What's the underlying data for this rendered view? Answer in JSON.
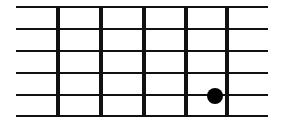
{
  "diagram": {
    "type": "fretboard",
    "colors": {
      "background": "#ffffff",
      "line": "#111111",
      "dot": "#000000"
    },
    "strings": [
      {
        "y": 7,
        "x1": 16,
        "x2": 268
      },
      {
        "y": 29,
        "x1": 16,
        "x2": 268
      },
      {
        "y": 51,
        "x1": 16,
        "x2": 268
      },
      {
        "y": 73,
        "x1": 16,
        "x2": 268
      },
      {
        "y": 95,
        "x1": 16,
        "x2": 268
      },
      {
        "y": 116,
        "x1": 16,
        "x2": 268
      }
    ],
    "frets": [
      {
        "x": 58,
        "y1": 7,
        "y2": 116
      },
      {
        "x": 101,
        "y1": 7,
        "y2": 116
      },
      {
        "x": 144,
        "y1": 7,
        "y2": 116
      },
      {
        "x": 186,
        "y1": 7,
        "y2": 116
      },
      {
        "x": 227,
        "y1": 7,
        "y2": 116
      }
    ],
    "dots": [
      {
        "cx": 215,
        "cy": 96,
        "r": 8,
        "string": 5,
        "fret": 5
      }
    ]
  }
}
